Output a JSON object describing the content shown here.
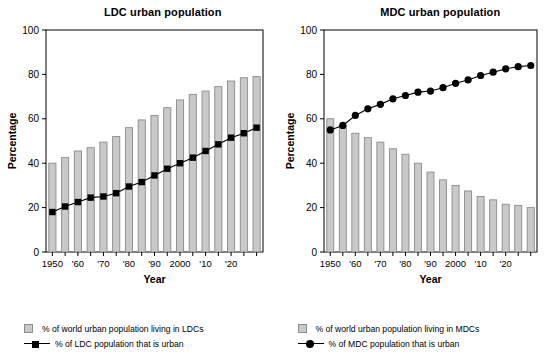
{
  "figure": {
    "width": 547,
    "height": 353,
    "background": "#ffffff",
    "bar_fill": "#c9c9c9",
    "bar_stroke": "#8a8a8a",
    "line_color": "#000000",
    "axis_color": "#000000"
  },
  "chart_data": [
    {
      "type": "bar",
      "title": "LDC urban population",
      "xlabel": "Year",
      "ylabel": "Percentage",
      "ylim": [
        0,
        100
      ],
      "yticks": [
        0,
        20,
        40,
        60,
        80,
        100
      ],
      "ytick_labels": [
        "0",
        "20",
        "40",
        "60",
        "80",
        "100"
      ],
      "grid": false,
      "legend_position": "below",
      "x": [
        1950,
        1955,
        1960,
        1965,
        1970,
        1975,
        1980,
        1985,
        1990,
        1995,
        2000,
        2005,
        2010,
        2015,
        2020,
        2025,
        2030
      ],
      "categories": [
        "1950",
        "1955",
        "1960",
        "1965",
        "1970",
        "1975",
        "1980",
        "1985",
        "1990",
        "1995",
        "2000",
        "2005",
        "2010",
        "2015",
        "2020",
        "2025",
        "2030"
      ],
      "xtick_labels": [
        "1950",
        "",
        "'60",
        "",
        "'70",
        "",
        "'80",
        "",
        "'90",
        "",
        "2000",
        "",
        "'10",
        "",
        "'20",
        "",
        ""
      ],
      "series": [
        {
          "name": "% of world urban population living in LDCs",
          "kind": "bar",
          "values": [
            40.0,
            42.5,
            45.5,
            47.0,
            49.5,
            52.0,
            56.0,
            59.5,
            61.5,
            65.0,
            68.5,
            71.0,
            72.5,
            74.5,
            77.0,
            78.5,
            79.0
          ]
        },
        {
          "name": "% of LDC population that is urban",
          "kind": "line",
          "marker": "square",
          "values": [
            18.0,
            20.5,
            22.5,
            24.5,
            25.0,
            26.5,
            29.5,
            31.5,
            34.5,
            37.5,
            40.0,
            42.5,
            45.5,
            48.5,
            51.5,
            53.5,
            56.0
          ]
        }
      ]
    },
    {
      "type": "bar",
      "title": "MDC urban population",
      "xlabel": "Year",
      "ylabel": "Percentage",
      "ylim": [
        0,
        100
      ],
      "yticks": [
        0,
        20,
        40,
        60,
        80,
        100
      ],
      "ytick_labels": [
        "0",
        "20",
        "40",
        "60",
        "80",
        "100"
      ],
      "grid": false,
      "legend_position": "below",
      "x": [
        1950,
        1955,
        1960,
        1965,
        1970,
        1975,
        1980,
        1985,
        1990,
        1995,
        2000,
        2005,
        2010,
        2015,
        2020,
        2025,
        2030
      ],
      "categories": [
        "1950",
        "1955",
        "1960",
        "1965",
        "1970",
        "1975",
        "1980",
        "1985",
        "1990",
        "1995",
        "2000",
        "2005",
        "2010",
        "2015",
        "2020",
        "2025",
        "2030"
      ],
      "xtick_labels": [
        "1950",
        "",
        "'60",
        "",
        "'70",
        "",
        "'80",
        "",
        "'90",
        "",
        "2000",
        "",
        "'10",
        "",
        "'20",
        "",
        ""
      ],
      "series": [
        {
          "name": "% of world urban population living in MDCs",
          "kind": "bar",
          "values": [
            60.0,
            57.0,
            53.5,
            51.5,
            49.5,
            46.5,
            44.0,
            40.0,
            36.0,
            32.5,
            30.0,
            27.5,
            25.0,
            23.5,
            21.5,
            21.0,
            20.0
          ]
        },
        {
          "name": "% of MDC population that is urban",
          "kind": "line",
          "marker": "circle",
          "values": [
            55.0,
            57.0,
            61.5,
            64.5,
            66.5,
            69.0,
            70.5,
            72.0,
            72.5,
            74.0,
            76.0,
            77.5,
            79.5,
            81.0,
            82.5,
            83.5,
            84.0
          ]
        }
      ]
    }
  ],
  "panels": [
    {
      "title": "LDC urban population",
      "ylabel": "Percentage",
      "xlabel": "Year",
      "legend": [
        {
          "marker": "swatch",
          "label": "% of world urban population living in LDCs"
        },
        {
          "marker": "line-square",
          "label": "% of LDC population that is urban"
        }
      ]
    },
    {
      "title": "MDC urban population",
      "ylabel": "Percentage",
      "xlabel": "Year",
      "legend": [
        {
          "marker": "swatch",
          "label": "% of world urban population living in MDCs"
        },
        {
          "marker": "line-circle",
          "label": "% of MDC population that is urban"
        }
      ]
    }
  ]
}
